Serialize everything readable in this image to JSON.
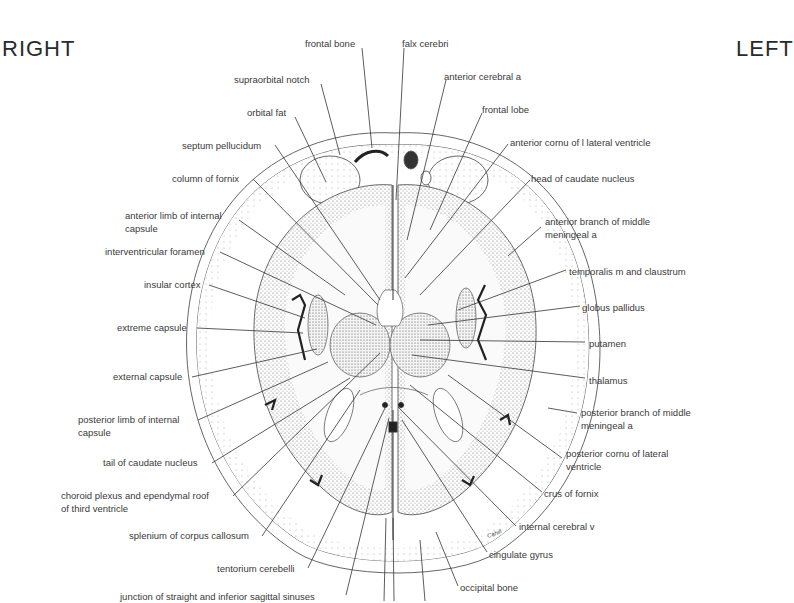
{
  "orientation": {
    "right": "RIGHT",
    "left": "LEFT"
  },
  "labels_left_side": [
    {
      "id": "supraorbital-notch",
      "text": "supraorbital notch",
      "x": 234,
      "y": 73
    },
    {
      "id": "orbital-fat",
      "text": "orbital fat",
      "x": 247,
      "y": 106
    },
    {
      "id": "septum-pellucidum",
      "text": "septum pellucidum",
      "x": 182,
      "y": 139
    },
    {
      "id": "column-of-fornix",
      "text": "column of fornix",
      "x": 172,
      "y": 172
    },
    {
      "id": "anterior-limb-internal-capsule",
      "text": "anterior limb of internal",
      "text2": "capsule",
      "x": 125,
      "y": 209
    },
    {
      "id": "interventricular-foramen",
      "text": "interventricular foramen",
      "x": 105,
      "y": 245
    },
    {
      "id": "insular-cortex",
      "text": "insular cortex",
      "x": 144,
      "y": 278
    },
    {
      "id": "extreme-capsule",
      "text": "extreme capsule",
      "x": 117,
      "y": 321
    },
    {
      "id": "external-capsule",
      "text": "external capsule",
      "x": 113,
      "y": 370
    },
    {
      "id": "posterior-limb-internal-capsule",
      "text": "posterior limb of internal",
      "text2": "capsule",
      "x": 78,
      "y": 413
    },
    {
      "id": "tail-of-caudate-nucleus",
      "text": "tail of caudate nucleus",
      "x": 103,
      "y": 456
    },
    {
      "id": "choroid-plexus",
      "text": "choroid plexus and ependymal roof",
      "text2": "of third ventricle",
      "x": 61,
      "y": 489
    },
    {
      "id": "splenium-corpus-callosum",
      "text": "splenium of corpus callosum",
      "x": 129,
      "y": 529
    },
    {
      "id": "tentorium-cerebelli",
      "text": "tentorium cerebelli",
      "x": 217,
      "y": 562
    },
    {
      "id": "junction-sinuses",
      "text": "junction of straight and inferior sagittal sinuses",
      "x": 120,
      "y": 590
    }
  ],
  "labels_top": [
    {
      "id": "frontal-bone",
      "text": "frontal bone",
      "x": 305,
      "y": 37
    },
    {
      "id": "falx-cerebri",
      "text": "falx cerebri",
      "x": 402,
      "y": 37
    }
  ],
  "labels_right_side": [
    {
      "id": "anterior-cerebral-a",
      "text": "anterior cerebral a",
      "x": 444,
      "y": 70
    },
    {
      "id": "frontal-lobe",
      "text": "frontal lobe",
      "x": 482,
      "y": 103
    },
    {
      "id": "anterior-cornu-lateral-ventricle",
      "text": "anterior cornu of l lateral ventricle",
      "x": 510,
      "y": 136
    },
    {
      "id": "head-of-caudate-nucleus",
      "text": "head of caudate nucleus",
      "x": 531,
      "y": 172
    },
    {
      "id": "anterior-branch-middle-meningeal",
      "text": "anterior branch of middle",
      "text2": "meningeal a",
      "x": 545,
      "y": 215
    },
    {
      "id": "temporalis-m-claustrum",
      "text": "temporalis m and claustrum",
      "x": 569,
      "y": 265
    },
    {
      "id": "globus-pallidus",
      "text": "globus pallidus",
      "x": 582,
      "y": 301
    },
    {
      "id": "putamen",
      "text": "putamen",
      "x": 589,
      "y": 337
    },
    {
      "id": "thalamus",
      "text": "thalamus",
      "x": 589,
      "y": 374
    },
    {
      "id": "posterior-branch-middle-meningeal",
      "text": "posterior branch of middle",
      "text2": "meningeal a",
      "x": 581,
      "y": 406
    },
    {
      "id": "posterior-cornu-lateral-ventricle",
      "text": "posterior cornu of lateral",
      "text2": "ventricle",
      "x": 566,
      "y": 447
    },
    {
      "id": "crus-of-fornix",
      "text": "crus of fornix",
      "x": 544,
      "y": 487
    },
    {
      "id": "internal-cerebral-v",
      "text": "internal cerebral v",
      "x": 519,
      "y": 520
    },
    {
      "id": "cingulate-gyrus",
      "text": "cingulate gyrus",
      "x": 489,
      "y": 548
    },
    {
      "id": "occipital-bone",
      "text": "occipital bone",
      "x": 460,
      "y": 581
    }
  ],
  "signature": "Cahill"
}
